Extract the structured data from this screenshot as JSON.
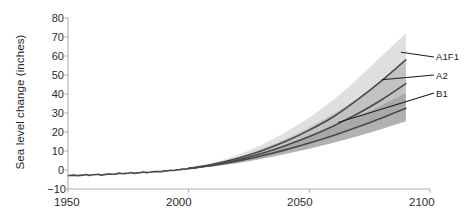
{
  "chart_data": {
    "type": "line",
    "title": "",
    "subtitle": "",
    "xlabel": "",
    "ylabel": "Sea level change (inches)",
    "xlim": [
      1950,
      2100
    ],
    "ylim": [
      -10,
      80
    ],
    "xticks": [
      1950,
      2000,
      2050,
      2100
    ],
    "yticks": [
      -10,
      0,
      10,
      20,
      30,
      40,
      50,
      60,
      70,
      80
    ],
    "grid": false,
    "legend_position": "right-inline-annotations",
    "annotations": [
      "A1F1",
      "A2",
      "B1"
    ],
    "colors": {
      "line_dark": "#4a4a4a",
      "band_light": "#d9d9d9",
      "band_mid": "#bdbdbd",
      "band_dark": "#a3a3a3",
      "axis": "#b0b0b0",
      "text": "#2b2b2b"
    },
    "observed": {
      "name": "Observed sea level",
      "x": [
        1950,
        1955,
        1960,
        1965,
        1970,
        1975,
        1980,
        1985,
        1990,
        1995,
        2000,
        2005
      ],
      "y": [
        -3.0,
        -2.8,
        -2.5,
        -2.4,
        -2.0,
        -1.7,
        -1.4,
        -1.0,
        -0.5,
        0.1,
        0.8,
        1.6
      ]
    },
    "series": [
      {
        "name": "A1F1",
        "label": "A1F1",
        "x": [
          2000,
          2010,
          2020,
          2030,
          2040,
          2050,
          2060,
          2070,
          2080,
          2090
        ],
        "y": [
          0.8,
          3.0,
          6.0,
          10.0,
          15.0,
          21.0,
          28.0,
          37.0,
          47.0,
          58.0
        ],
        "lower": [
          0.8,
          2.2,
          4.4,
          7.2,
          10.8,
          15.0,
          20.0,
          26.0,
          33.0,
          41.0
        ],
        "upper": [
          0.8,
          3.8,
          7.8,
          13.2,
          19.8,
          27.6,
          37.0,
          48.0,
          60.0,
          72.0
        ]
      },
      {
        "name": "A2",
        "label": "A2",
        "x": [
          2000,
          2010,
          2020,
          2030,
          2040,
          2050,
          2060,
          2070,
          2080,
          2090
        ],
        "y": [
          0.8,
          2.6,
          5.2,
          8.6,
          12.8,
          17.6,
          23.2,
          29.6,
          37.0,
          45.5
        ],
        "lower": [
          0.8,
          2.0,
          4.0,
          6.6,
          9.8,
          13.4,
          17.6,
          22.4,
          28.0,
          34.0
        ],
        "upper": [
          0.8,
          3.2,
          6.6,
          11.0,
          16.2,
          22.4,
          29.6,
          37.8,
          47.0,
          57.0
        ]
      },
      {
        "name": "B1",
        "label": "B1",
        "x": [
          2000,
          2010,
          2020,
          2030,
          2040,
          2050,
          2060,
          2070,
          2080,
          2090
        ],
        "y": [
          0.8,
          2.4,
          4.6,
          7.4,
          10.6,
          14.2,
          18.2,
          22.6,
          27.4,
          32.5
        ],
        "lower": [
          0.8,
          1.8,
          3.6,
          5.8,
          8.4,
          11.2,
          14.4,
          17.8,
          21.6,
          25.6
        ],
        "upper": [
          0.8,
          3.0,
          5.8,
          9.2,
          13.2,
          17.6,
          22.6,
          28.0,
          34.0,
          40.5
        ]
      }
    ]
  },
  "axis": {
    "y_title": "Sea level change (inches)",
    "y_tick_labels": [
      "80",
      "70",
      "60",
      "50",
      "40",
      "30",
      "20",
      "10",
      "0",
      "−10"
    ],
    "x_tick_labels": [
      "1950",
      "2000",
      "2050",
      "2100"
    ]
  },
  "annotations": {
    "a1f1": "A1F1",
    "a2": "A2",
    "b1": "B1"
  }
}
